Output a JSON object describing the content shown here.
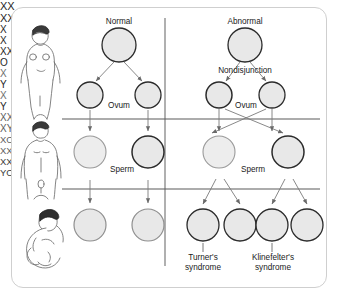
{
  "diagram": {
    "colors": {
      "card_border": "#cfcfcf",
      "circle_fill": "#e8e8e8",
      "circle_stroke_dark": "#1f1f1f",
      "circle_stroke_light": "#9a9a9a",
      "line": "#4a4a4a",
      "text": "#1a1a1a"
    },
    "columns": [
      {
        "name": "normal",
        "heading": "Normal"
      },
      {
        "name": "abnormal",
        "heading": "Abnormal"
      }
    ],
    "annotations": {
      "nondisjunction": "Nondisjunction",
      "ovum_left": "Ovum",
      "ovum_right": "Ovum",
      "sperm_left": "Sperm",
      "sperm_right": "Sperm"
    },
    "figures": [
      {
        "name": "female-figure",
        "row": "maternal"
      },
      {
        "name": "male-figure",
        "row": "paternal"
      },
      {
        "name": "infant-figure",
        "row": "offspring"
      }
    ],
    "rows": {
      "parent": {
        "normal": [
          {
            "id": "p-n-1",
            "label": "XX"
          }
        ],
        "abnormal": [
          {
            "id": "p-a-1",
            "label": "XX"
          }
        ]
      },
      "ovum": {
        "normal": [
          {
            "id": "ov-n-1",
            "label": "X"
          },
          {
            "id": "ov-n-2",
            "label": "X"
          }
        ],
        "abnormal": [
          {
            "id": "ov-a-1",
            "label": "XX"
          },
          {
            "id": "ov-a-2",
            "label": "O"
          }
        ]
      },
      "sperm": {
        "normal": [
          {
            "id": "sp-n-1",
            "label": "X"
          },
          {
            "id": "sp-n-2",
            "label": "Y"
          }
        ],
        "abnormal": [
          {
            "id": "sp-a-1",
            "label": "X"
          },
          {
            "id": "sp-a-2",
            "label": "Y"
          }
        ]
      },
      "offspring": {
        "normal": [
          {
            "id": "of-n-1",
            "label": "XX"
          },
          {
            "id": "of-n-2",
            "label": "XY"
          }
        ],
        "abnormal": [
          {
            "id": "of-a-1",
            "label": "XO"
          },
          {
            "id": "of-a-2",
            "label": "XXX"
          },
          {
            "id": "of-a-3",
            "label": "XXY"
          },
          {
            "id": "of-a-4",
            "label": "YO"
          }
        ]
      }
    },
    "outcome_labels": [
      {
        "id": "turner",
        "line1": "Turner's",
        "line2": "syndrome"
      },
      {
        "id": "klinefelter",
        "line1": "Klinefelter's",
        "line2": "syndrome"
      }
    ]
  }
}
